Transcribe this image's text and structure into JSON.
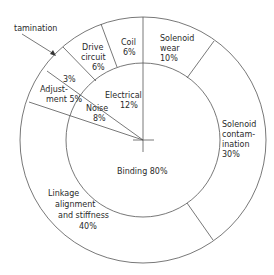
{
  "diagram": {
    "type": "two-level pie (sunburst) diagram",
    "inner_ring": [
      {
        "name": "binding",
        "lines": [
          "Binding 80%"
        ],
        "label": "Binding",
        "percent": "80%"
      },
      {
        "name": "electrical",
        "lines": [
          "Electrical",
          "12%"
        ],
        "label": "Electrical",
        "percent": "12%"
      },
      {
        "name": "noise",
        "lines": [
          "Noise",
          "8%"
        ],
        "label": "Noise",
        "percent": "8%"
      }
    ],
    "outer_ring": [
      {
        "name": "solenoid-wear",
        "lines": [
          "Solenoid",
          "wear",
          "10%"
        ],
        "parent": "binding"
      },
      {
        "name": "solenoid-contamination",
        "lines": [
          "Solenoid",
          "contam-",
          "ination",
          "30%"
        ],
        "parent": "binding"
      },
      {
        "name": "linkage-alignment",
        "lines": [
          "Linkage",
          "alignment",
          "and stiffness",
          "40%"
        ],
        "parent": "binding"
      },
      {
        "name": "adjustment",
        "lines": [
          "Adjust-",
          "ment 5%"
        ],
        "parent": "noise"
      },
      {
        "name": "contamination-3",
        "lines": [
          "3%"
        ],
        "parent": "noise"
      },
      {
        "name": "drive-circuit",
        "lines": [
          "Drive",
          "circuit",
          "6%"
        ],
        "parent": "electrical"
      },
      {
        "name": "coil",
        "lines": [
          "Coil",
          "6%"
        ],
        "parent": "electrical"
      }
    ],
    "callout": {
      "label": "tamination"
    },
    "colors": {
      "stroke": "#555555",
      "text": "#2a2a2a",
      "background": "#ffffff"
    }
  }
}
